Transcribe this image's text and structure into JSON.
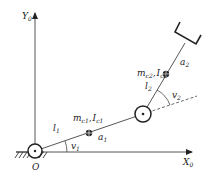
{
  "diagram": {
    "type": "two-link planar robot arm schematic",
    "axes": {
      "x_label": "X",
      "x_sub": "0",
      "y_label": "Y",
      "y_sub": "0",
      "origin_label": "O"
    },
    "link1": {
      "length_label": "l",
      "length_sub": "1",
      "mass_label": "m",
      "mass_sub": "c1",
      "inertia_label": "I",
      "inertia_sub": "c1",
      "com_distance_label": "a",
      "com_distance_sub": "1",
      "angle_label": "v",
      "angle_sub": "1"
    },
    "link2": {
      "length_label": "l",
      "length_sub": "2",
      "mass_label": "m",
      "mass_sub": "c2",
      "inertia_label": "I",
      "inertia_sub": "c2",
      "com_distance_label": "a",
      "com_distance_sub": "2",
      "angle_label": "v",
      "angle_sub": "2"
    },
    "separator": ",",
    "colors": {
      "stroke": "#333333",
      "background": "#ffffff"
    }
  }
}
